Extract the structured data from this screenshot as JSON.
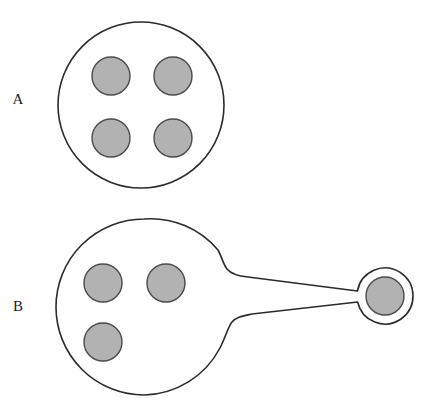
{
  "figure": {
    "width": 428,
    "height": 413,
    "background_color": "#ffffff",
    "outline_color": "#2b2b2b",
    "granule_fill_color": "#b2b2b2",
    "granule_stroke_color": "#4a4a4a",
    "label_color": "#1a1a1a"
  },
  "panels": [
    {
      "id": "panel-a",
      "label": "A",
      "label_position": {
        "x": 18,
        "y": 101
      },
      "cell": {
        "name": "mother-cell",
        "center": {
          "x": 141,
          "y": 105
        },
        "radius": 83
      },
      "granules": [
        {
          "name": "granule-top-left",
          "center": {
            "x": 111,
            "y": 76
          },
          "radius": 19
        },
        {
          "name": "granule-top-right",
          "center": {
            "x": 173,
            "y": 76
          },
          "radius": 19
        },
        {
          "name": "granule-bottom-left",
          "center": {
            "x": 111,
            "y": 138
          },
          "radius": 19
        },
        {
          "name": "granule-bottom-right",
          "center": {
            "x": 173,
            "y": 138
          },
          "radius": 19
        }
      ],
      "granule_count": 4,
      "bud": null
    },
    {
      "id": "panel-b",
      "label": "B",
      "label_position": {
        "x": 18,
        "y": 308
      },
      "cell": {
        "name": "mother-cell",
        "center": {
          "x": 144,
          "y": 307
        },
        "radius": 88
      },
      "granules": [
        {
          "name": "granule-upper-left",
          "center": {
            "x": 103,
            "y": 283
          },
          "radius": 19
        },
        {
          "name": "granule-upper-right",
          "center": {
            "x": 166,
            "y": 283
          },
          "radius": 19
        },
        {
          "name": "granule-lower-left",
          "center": {
            "x": 103,
            "y": 342
          },
          "radius": 19
        }
      ],
      "granule_count": 3,
      "bud": {
        "name": "daughter-bud",
        "center": {
          "x": 385,
          "y": 296
        },
        "radius": 28,
        "granule": {
          "name": "bud-granule",
          "center": {
            "x": 385,
            "y": 296
          },
          "radius": 19
        }
      },
      "neck": {
        "name": "connecting-tube",
        "start_x": 214,
        "end_x": 359,
        "top_y_start": 280,
        "top_y_end": 291,
        "bottom_y_start": 322,
        "bottom_y_end": 302
      }
    }
  ]
}
